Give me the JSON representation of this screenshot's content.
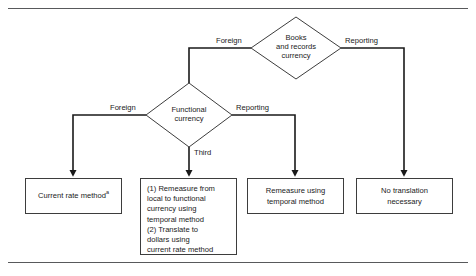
{
  "figure": {
    "type": "flowchart",
    "orientation": "top-down",
    "nodes": {
      "decision_top": {
        "shape": "diamond",
        "label_lines": [
          "Books",
          "and records",
          "currency"
        ]
      },
      "decision_mid": {
        "shape": "diamond",
        "label_lines": [
          "Functional",
          "currency"
        ]
      },
      "outcome_1": {
        "shape": "rectangle",
        "text": "Current rate method",
        "footnote_marker": "a"
      },
      "outcome_2": {
        "shape": "rectangle",
        "text": "(1) Remeasure from\nlocal to functional\ncurrency using\ntemporal method\n(2) Translate to\ndollars using\ncurrent rate method"
      },
      "outcome_3": {
        "shape": "rectangle",
        "text": "Remeasure using\ntemporal method"
      },
      "outcome_4": {
        "shape": "rectangle",
        "text": "No translation\nnecessary"
      }
    },
    "edge_labels": {
      "top_left": "Foreign",
      "top_right": "Reporting",
      "mid_left": "Foreign",
      "mid_right": "Reporting",
      "mid_down": "Third"
    },
    "edges": [
      {
        "from": "decision_top",
        "label": "Foreign",
        "to": "decision_mid"
      },
      {
        "from": "decision_top",
        "label": "Reporting",
        "to": "outcome_4"
      },
      {
        "from": "decision_mid",
        "label": "Foreign",
        "to": "outcome_1"
      },
      {
        "from": "decision_mid",
        "label": "Third",
        "to": "outcome_2"
      },
      {
        "from": "decision_mid",
        "label": "Reporting",
        "to": "outcome_3"
      }
    ],
    "colors": {
      "line": "#3d3d3d",
      "rule": "#58595b",
      "text": "#1a1a1a",
      "background": "#ffffff"
    }
  }
}
